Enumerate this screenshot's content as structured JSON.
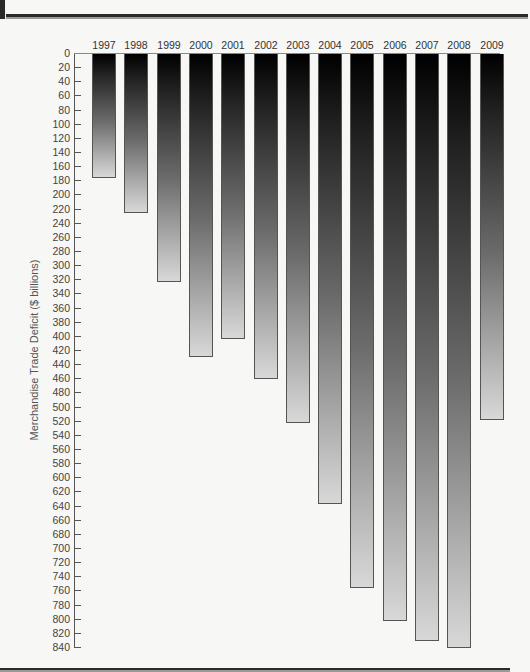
{
  "chart_data": {
    "type": "bar",
    "orientation": "vertical-hanging",
    "title": "",
    "xlabel": "",
    "ylabel": "Merchandise Trade Deficit ($ billions)",
    "ylim": [
      0,
      840
    ],
    "y_axis_inverted": true,
    "y_ticks": [
      0,
      20,
      40,
      60,
      80,
      100,
      120,
      140,
      160,
      180,
      200,
      220,
      240,
      260,
      280,
      300,
      320,
      340,
      360,
      380,
      400,
      420,
      440,
      460,
      480,
      500,
      520,
      540,
      560,
      580,
      600,
      620,
      640,
      660,
      680,
      700,
      720,
      740,
      760,
      780,
      800,
      820,
      840
    ],
    "categories": [
      "1997",
      "1998",
      "1999",
      "2000",
      "2001",
      "2002",
      "2003",
      "2004",
      "2005",
      "2006",
      "2007",
      "2008",
      "2009"
    ],
    "values": [
      176,
      225,
      322,
      429,
      403,
      459,
      522,
      637,
      755,
      802,
      830,
      840,
      517
    ],
    "legend": null,
    "grid": false
  },
  "colors": {
    "bar_top": "#000000",
    "bar_bottom": "#d8d8d8",
    "background": "#f7f7f5",
    "rule": "#2b2b2b"
  }
}
